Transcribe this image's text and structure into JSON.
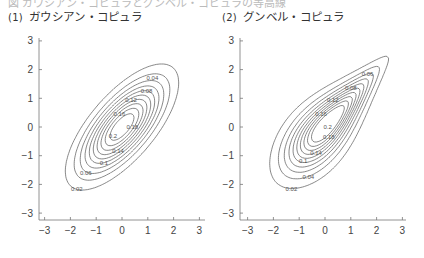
{
  "header_cut_text": "図 ガウシアン・コピュラとグンベル・コピュラの等高線",
  "panels": [
    {
      "number": "(1)",
      "title": "ガウシアン・コピュラ"
    },
    {
      "number": "(2)",
      "title": "グンベル・コピュラ"
    }
  ],
  "chart_data": [
    {
      "type": "contour",
      "title": "(1) ガウシアン・コピュラ",
      "xlabel": "",
      "ylabel": "",
      "xlim": [
        -3.2,
        3.2
      ],
      "ylim": [
        -3.2,
        3.2
      ],
      "xticks": [
        -3,
        -2,
        -1,
        0,
        1,
        2,
        3
      ],
      "yticks": [
        -3,
        -2,
        -1,
        0,
        1,
        2,
        3
      ],
      "levels": [
        0.02,
        0.04,
        0.06,
        0.08,
        0.1,
        0.12,
        0.14,
        0.16,
        0.18,
        0.2
      ],
      "labeled_levels": [
        "0.02",
        "0.04",
        "0.06",
        "0.08",
        "0.1",
        "0.12",
        "0.14",
        "0.16",
        "0.18",
        "0.2"
      ],
      "copula": "gaussian",
      "rho": 0.7,
      "grid": false
    },
    {
      "type": "contour",
      "title": "(2) グンベル・コピュラ",
      "xlabel": "",
      "ylabel": "",
      "xlim": [
        -3.2,
        3.2
      ],
      "ylim": [
        -3.2,
        3.2
      ],
      "xticks": [
        -3,
        -2,
        -1,
        0,
        1,
        2,
        3
      ],
      "yticks": [
        -3,
        -2,
        -1,
        0,
        1,
        2,
        3
      ],
      "levels": [
        0.02,
        0.04,
        0.06,
        0.08,
        0.1,
        0.12,
        0.14,
        0.16,
        0.18,
        0.2
      ],
      "labeled_levels": [
        "0.02",
        "0.04",
        "0.06",
        "0.08",
        "0.1",
        "0.12",
        "0.14",
        "0.16",
        "0.18",
        "0.2"
      ],
      "copula": "gumbel",
      "grid": false
    }
  ]
}
